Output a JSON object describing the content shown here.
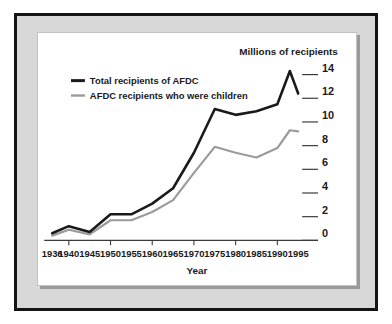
{
  "chart_data": {
    "type": "line",
    "title": "",
    "xlabel": "Year",
    "ylabel": "Millions of recipients",
    "ylim": [
      0,
      15
    ],
    "xlim": [
      1936,
      1995
    ],
    "grid": false,
    "legend_position": "top-left",
    "yticks": [
      "0",
      "2",
      "4",
      "6",
      "8",
      "10",
      "12",
      "14"
    ],
    "ytick_values": [
      0,
      2,
      4,
      6,
      8,
      10,
      12,
      14
    ],
    "xticks": [
      "1936",
      "1940",
      "1945",
      "1950",
      "1955",
      "1960",
      "1965",
      "1970",
      "1975",
      "1980",
      "1985",
      "1990",
      "1995"
    ],
    "xtick_values": [
      1936,
      1940,
      1945,
      1950,
      1955,
      1960,
      1965,
      1970,
      1975,
      1980,
      1985,
      1990,
      1995
    ],
    "x": [
      1936,
      1940,
      1945,
      1950,
      1955,
      1960,
      1965,
      1970,
      1975,
      1980,
      1985,
      1990,
      1993,
      1995
    ],
    "series": [
      {
        "name": "Total recipients of AFDC",
        "color": "#1a1a1a",
        "values": [
          0.6,
          1.2,
          0.7,
          2.2,
          2.2,
          3.1,
          4.4,
          7.4,
          11.1,
          10.6,
          10.9,
          11.5,
          14.3,
          12.4
        ]
      },
      {
        "name": "AFDC recipients who were children",
        "color": "#9b9b9b",
        "values": [
          0.4,
          0.9,
          0.5,
          1.7,
          1.7,
          2.4,
          3.4,
          5.7,
          7.9,
          7.4,
          7.0,
          7.8,
          9.3,
          9.2
        ]
      }
    ]
  },
  "legend": {
    "items": [
      {
        "label": "Total recipients of AFDC",
        "color": "#1a1a1a"
      },
      {
        "label": "AFDC recipients who were children",
        "color": "#9b9b9b"
      }
    ]
  },
  "colors": {
    "frame_border": "#141414",
    "mat": "#d8d8d8",
    "panel": "#ffffff",
    "axis": "#3a3a3a",
    "total_line": "#1a1a1a",
    "children_line": "#9b9b9b"
  }
}
